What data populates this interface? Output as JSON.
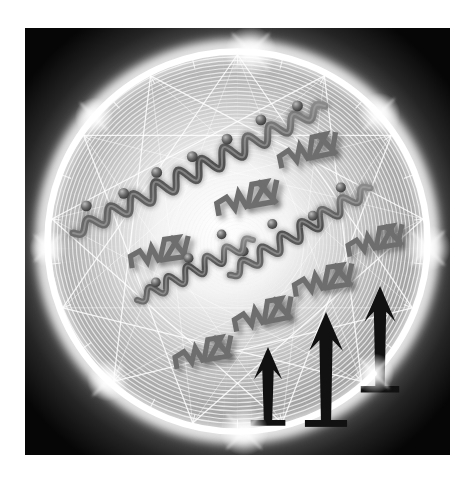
{
  "canvas": {
    "width": 476,
    "height": 483,
    "page_background": "#ffffff",
    "title": "Abstract illustration: glowing web sphere with squiggles, zigzag glyphs and arrows"
  },
  "panel": {
    "name": "artwork-panel",
    "x": 25,
    "y": 28,
    "width": 425,
    "height": 427,
    "corner_color": "#0b0b0b",
    "mid_color": "#8c8c8c",
    "center_color": "#ffffff"
  },
  "sphere": {
    "name": "glowing-web-sphere",
    "cx": 238,
    "cy": 242,
    "radius": 196,
    "ring_color": "#ffffff",
    "ring_width": 7,
    "glow_color": "#ffffff",
    "web_color": "#f2f2f2",
    "spiral_rings": 46,
    "spiral_inner_radius": 16,
    "polygon_points": 13
  },
  "sparkles": [
    {
      "name": "sparkle-top",
      "angle_deg": -86,
      "size": 62
    },
    {
      "name": "sparkle-top-right",
      "angle_deg": -42,
      "size": 52
    },
    {
      "name": "sparkle-right",
      "angle_deg": 2,
      "size": 56
    },
    {
      "name": "sparkle-bottom-right",
      "angle_deg": 44,
      "size": 48
    },
    {
      "name": "sparkle-bottom",
      "angle_deg": 88,
      "size": 58
    },
    {
      "name": "sparkle-bottom-left",
      "angle_deg": 133,
      "size": 50
    },
    {
      "name": "sparkle-left",
      "angle_deg": 178,
      "size": 44
    },
    {
      "name": "sparkle-top-left",
      "angle_deg": -139,
      "size": 46
    }
  ],
  "squiggles": [
    {
      "name": "squiggle-upper",
      "label": "wavy chain with beads (upper left to upper right)",
      "x1": 48,
      "y1": 205,
      "x2": 300,
      "y2": 78,
      "waves": 11,
      "amplitude": 9,
      "thickness": 7,
      "color": "#5b5b5b",
      "beads": 7,
      "bead_radius": 5.4,
      "bead_offset": -15
    },
    {
      "name": "squiggle-middle",
      "label": "wavy chain with beads (center to right)",
      "x1": 205,
      "y1": 247,
      "x2": 345,
      "y2": 160,
      "waves": 7,
      "amplitude": 8,
      "thickness": 6.5,
      "color": "#5b5b5b",
      "beads": 4,
      "bead_radius": 5.0,
      "bead_offset": -14
    },
    {
      "name": "squiggle-lower",
      "label": "wavy chain with beads (lower left to center)",
      "x1": 112,
      "y1": 272,
      "x2": 228,
      "y2": 212,
      "waves": 6,
      "amplitude": 7.5,
      "thickness": 6,
      "color": "#5b5b5b",
      "beads": 3,
      "bead_radius": 4.8,
      "bead_offset": -13
    }
  ],
  "zigzag_glyphs": {
    "label": "stylized N/Z zigzag marks",
    "color": "#6e6e6e",
    "items": [
      {
        "name": "zigzag-glyph-1",
        "x": 285,
        "y": 128,
        "scale": 1.0,
        "rotate": -12
      },
      {
        "name": "zigzag-glyph-2",
        "x": 224,
        "y": 176,
        "scale": 1.05,
        "rotate": -10
      },
      {
        "name": "zigzag-glyph-3",
        "x": 136,
        "y": 230,
        "scale": 1.0,
        "rotate": -8
      },
      {
        "name": "zigzag-glyph-4",
        "x": 352,
        "y": 218,
        "scale": 0.95,
        "rotate": -10
      },
      {
        "name": "zigzag-glyph-5",
        "x": 300,
        "y": 258,
        "scale": 1.0,
        "rotate": -9
      },
      {
        "name": "zigzag-glyph-6",
        "x": 240,
        "y": 292,
        "scale": 1.0,
        "rotate": -11
      },
      {
        "name": "zigzag-glyph-7",
        "x": 180,
        "y": 330,
        "scale": 0.98,
        "rotate": -10
      }
    ]
  },
  "arrows": {
    "label": "upward arrows with base bars",
    "color": "#111111",
    "items": [
      {
        "name": "arrow-left",
        "x": 243,
        "y": 392,
        "height": 73,
        "width": 28,
        "scale": 0.88
      },
      {
        "name": "arrow-middle",
        "x": 301,
        "y": 392,
        "height": 108,
        "width": 34,
        "scale": 1.06
      },
      {
        "name": "arrow-right",
        "x": 355,
        "y": 358,
        "height": 100,
        "width": 31,
        "scale": 1.0
      }
    ]
  }
}
